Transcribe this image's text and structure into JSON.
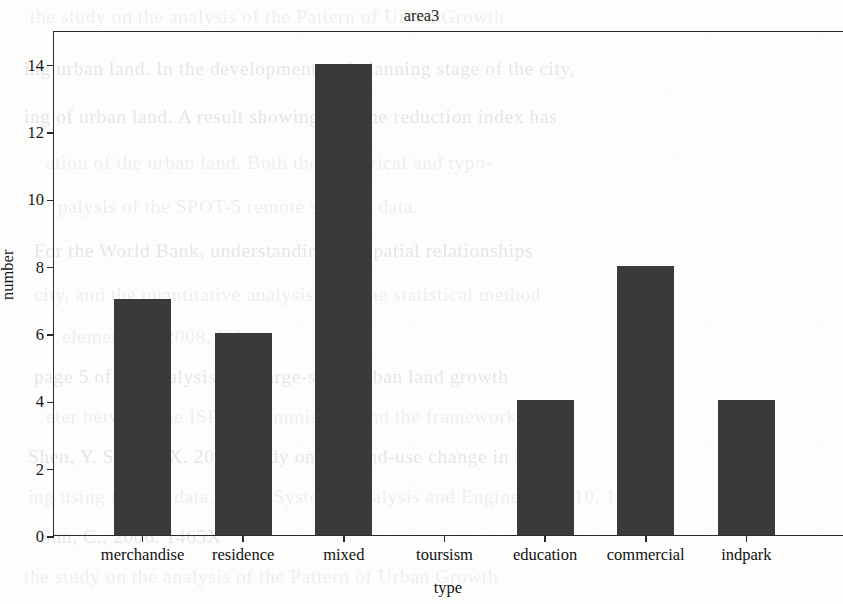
{
  "chart_data": {
    "type": "bar",
    "title": "area3",
    "xlabel": "type",
    "ylabel": "number",
    "categories": [
      "merchandise",
      "residence",
      "mixed",
      "toursism",
      "education",
      "commercial",
      "indpark"
    ],
    "values": [
      7,
      6,
      14,
      0,
      4,
      8,
      4
    ],
    "yticks": [
      0,
      2,
      4,
      6,
      8,
      10,
      12,
      14
    ],
    "ytick_labels": [
      "0",
      "2",
      "4",
      "6",
      "8",
      "10",
      "12",
      "14"
    ],
    "ylim": [
      0,
      15
    ],
    "grid": false,
    "legend": null,
    "bar_color": "#3a3a3a",
    "axis_color": "#2a2a2a"
  },
  "background": {
    "kind": "scanned-document-ghost-text",
    "lines": [
      "the study on the analysis of the Pattern of Urban Growth",
      "ing urban land. In the development and planning stage of the city,",
      "ing of urban land. A result showing that the reduction index has",
      "ation of the urban land. Both the numerical and typo-",
      "palysis of the SPOT-5 remote sensing data.",
      "For the World Bank, understanding the spatial relationships",
      "city, and the quantitative analysis with the statistical method",
      "elements of 2008, [2].",
      "page 5 of the analysis of a large-scale urban land growth",
      "eter between the ISPRS Commission and the framework",
      "Shen, Y. Sun, Y. X. 2007 Study on the land-use change in Fujian",
      "ing using remote data. Int. J. Systems Analysis and Engineering, 10, 1-6.",
      "Sun, C., 2006. 1465X"
    ]
  }
}
